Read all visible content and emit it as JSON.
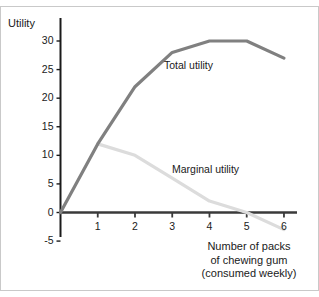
{
  "figure": {
    "border_color": "#c9c9c9",
    "background": "#ffffff"
  },
  "axes": {
    "y_title": "Utility",
    "x_title_line1": "Number of packs",
    "x_title_line2": "of chewing gum",
    "x_title_line3": "(consumed weekly)",
    "axis_color": "#1a1a1a"
  },
  "labels": {
    "total": "Total utility",
    "marginal": "Marginal utility"
  },
  "chart_data": {
    "type": "line",
    "title": "",
    "subtitle": "",
    "xlabel": "Number of packs of chewing gum (consumed weekly)",
    "ylabel": "Utility",
    "x": [
      0,
      1,
      2,
      3,
      4,
      5,
      6
    ],
    "xlim": [
      0,
      6.35
    ],
    "ylim": [
      -5,
      32
    ],
    "xticks": [
      1,
      2,
      3,
      4,
      5,
      6
    ],
    "xticklabels": [
      "1",
      "2",
      "3",
      "4",
      "5",
      "6"
    ],
    "yticks": [
      -5,
      0,
      5,
      10,
      15,
      20,
      25,
      30
    ],
    "yticklabels": [
      "-5",
      "0",
      "5",
      "10",
      "15",
      "20",
      "25",
      "30"
    ],
    "grid": false,
    "legend": "inline-annotations",
    "series": [
      {
        "name": "Total utility",
        "color": "#808080",
        "linewidth": 3,
        "x": [
          0,
          1,
          2,
          3,
          4,
          5,
          6
        ],
        "values": [
          0,
          12,
          22,
          28,
          30,
          30,
          27
        ]
      },
      {
        "name": "Marginal utility",
        "color": "#dcdcdc",
        "linewidth": 3,
        "x": [
          1,
          2,
          3,
          4,
          5,
          6
        ],
        "values": [
          12,
          10,
          6,
          2,
          0,
          -3
        ]
      }
    ],
    "annotations": [
      {
        "text": "Total utility",
        "x": 3.1,
        "y": 25.2
      },
      {
        "text": "Marginal utility",
        "x": 3.3,
        "y": 7.0
      }
    ]
  }
}
